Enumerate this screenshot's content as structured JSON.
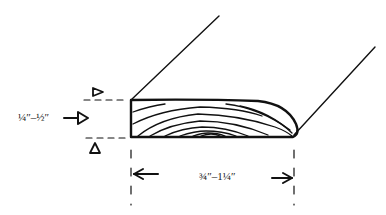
{
  "diagram": {
    "thickness_label": "¼″–½″",
    "width_label": "¾″–1¼″",
    "colors": {
      "ink": "#111111",
      "background": "#ffffff"
    }
  }
}
